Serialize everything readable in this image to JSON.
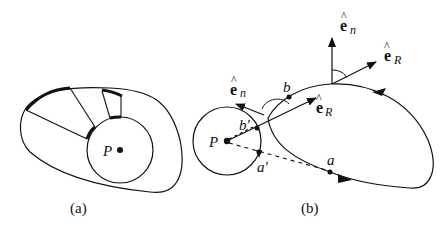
{
  "panel_a": {
    "caption": "(a)",
    "point_label": "P"
  },
  "panel_b": {
    "caption": "(b)",
    "point_label": "P",
    "labels": {
      "a": "a",
      "a_prime": "a′",
      "b": "b",
      "b_prime": "b′",
      "en_left_base": "e",
      "en_left_sub": "n",
      "en_top_base": "e",
      "en_top_sub": "n",
      "er_mid_base": "e",
      "er_mid_sub": "R",
      "er_top_base": "e",
      "er_top_sub": "R",
      "hat": "^"
    }
  },
  "colors": {
    "stroke": "#111111",
    "background": "#ffffff"
  }
}
